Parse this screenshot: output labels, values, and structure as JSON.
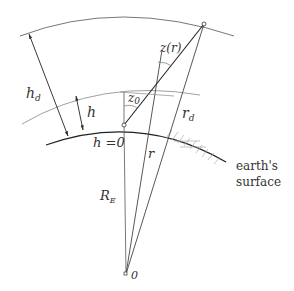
{
  "diagram": {
    "labels": {
      "hd_main": "h",
      "hd_sub": "d",
      "h": "h",
      "h_zero": "h =0",
      "z0_main": "z",
      "z0_sub": "0",
      "zr": "z(r)",
      "rd_main": "r",
      "rd_sub": "d",
      "r": "r",
      "RE_main": "R",
      "RE_sub": "E",
      "origin": "0",
      "surface_line1": "earth's",
      "surface_line2": "surface"
    },
    "colors": {
      "line": "#333333",
      "thin_line": "#777777",
      "hatch": "#999999",
      "background": "#ffffff"
    }
  }
}
